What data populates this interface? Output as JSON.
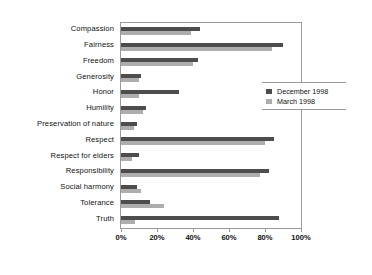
{
  "chart_data": {
    "type": "bar",
    "orientation": "horizontal",
    "title": "",
    "xlabel": "",
    "ylabel": "",
    "xlim": [
      0,
      100
    ],
    "xtick_labels": [
      "0%",
      "20%",
      "40%",
      "60%",
      "80%",
      "100%"
    ],
    "xtick_values": [
      0,
      20,
      40,
      60,
      80,
      100
    ],
    "grid": false,
    "legend_position": "right",
    "categories": [
      "Compassion",
      "Fairness",
      "Freedom",
      "Generosity",
      "Honor",
      "Humility",
      "Preservation of nature",
      "Respect",
      "Respect for elders",
      "Responsibility",
      "Social harmony",
      "Tolerance",
      "Truth"
    ],
    "series": [
      {
        "name": "December 1998",
        "color": "#4d4d4d",
        "values": [
          44,
          90,
          43,
          11,
          32,
          14,
          9,
          85,
          10,
          82,
          9,
          16,
          88
        ]
      },
      {
        "name": "March 1998",
        "color": "#adadad",
        "values": [
          39,
          84,
          40,
          10,
          10,
          12,
          7,
          80,
          6,
          77,
          11,
          24,
          8
        ]
      }
    ]
  }
}
